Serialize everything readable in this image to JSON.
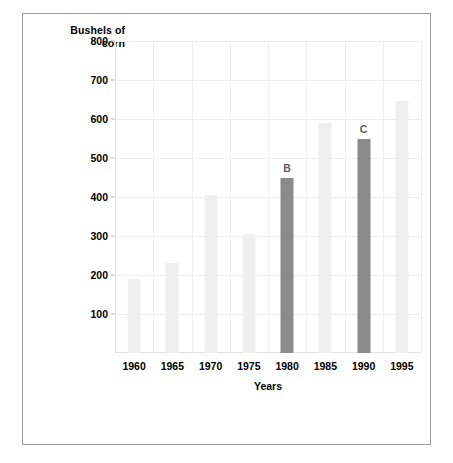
{
  "chart_data": {
    "type": "bar",
    "title": "",
    "xlabel": "Years",
    "ylabel": "Bushels of corn",
    "ylabel_line1": "Bushels of",
    "ylabel_line2": "corn",
    "categories": [
      "1960",
      "1965",
      "1970",
      "1975",
      "1980",
      "1985",
      "1990",
      "1995"
    ],
    "values": [
      190,
      230,
      405,
      305,
      450,
      590,
      550,
      645
    ],
    "ylim": [
      0,
      800
    ],
    "yticks": [
      "100",
      "200",
      "300",
      "400",
      "500",
      "600",
      "700",
      "800"
    ],
    "ytick_values": [
      100,
      200,
      300,
      400,
      500,
      600,
      700,
      800
    ],
    "grid": true,
    "legend": "none",
    "bar_colors": [
      "#efefef",
      "#efefef",
      "#efefef",
      "#efefef",
      "#8a8a8a",
      "#efefef",
      "#8a8a8a",
      "#efefef"
    ],
    "annotations": [
      {
        "category": "1980",
        "label": "B",
        "value": 450
      },
      {
        "category": "1990",
        "label": "C",
        "value": 550
      }
    ],
    "colors": {
      "bar_light": "#efefef",
      "bar_dark": "#8a8a8a",
      "gridline": "#ededed",
      "axis": "#e2e2e2",
      "frame_border": "#9b9b9b",
      "text": "#000000",
      "annotation_text": "#5c5c5c",
      "background": "#ffffff"
    }
  }
}
